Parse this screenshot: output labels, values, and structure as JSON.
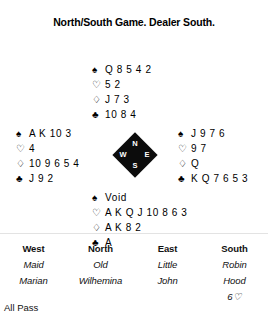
{
  "title": "North/South Game. Dealer South.",
  "suits": {
    "spade": "♠",
    "heart": "♡",
    "diamond": "♢",
    "club": "♣"
  },
  "hands": {
    "north": {
      "position": "North",
      "spades": "Q 8 5 4 2",
      "hearts": "5 2",
      "diamonds": "J 7 3",
      "clubs": "10 8 4"
    },
    "west": {
      "position": "West",
      "spades": "A K 10 3",
      "hearts": "4",
      "diamonds": "10 9 6 5 4",
      "clubs": "J 9 2"
    },
    "east": {
      "position": "East",
      "spades": "J 9 7 6",
      "hearts": "9 7",
      "diamonds": "Q",
      "clubs": "K Q 7 6 5 3"
    },
    "south": {
      "position": "South",
      "spades": "Void",
      "hearts": "A K Q J 10 8 6 3",
      "diamonds": "A K 8 2",
      "clubs": "A"
    }
  },
  "compass": {
    "north": "N",
    "west": "W",
    "east": "E",
    "south": "S"
  },
  "bidding": {
    "headers": [
      "West",
      "North",
      "East",
      "South"
    ],
    "name_line1": [
      "Maid",
      "Old",
      "Little",
      "Robin"
    ],
    "name_line2": [
      "Marian",
      "Wilhemina",
      "John",
      "Hood"
    ],
    "calls": [
      "",
      "",
      "",
      "6♡"
    ],
    "all_pass": "All Pass"
  }
}
